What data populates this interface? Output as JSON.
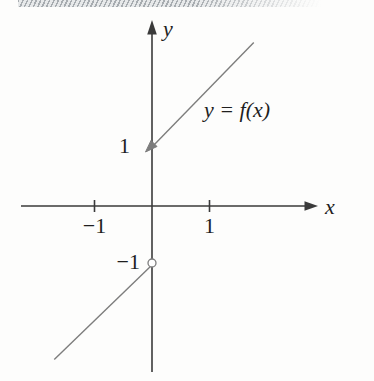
{
  "colors": {
    "axis": "#3a3a3a",
    "curve": "#7d7d7d",
    "text": "#1f1f1f",
    "band-dark": "#a7acb0",
    "band-light": "#e7e9ea",
    "bg": "#fdfdfc"
  },
  "figure": {
    "axis_labels": {
      "x": "x",
      "y": "y"
    },
    "curve_label": "y = f(x)",
    "x_tick_labels": [
      {
        "value": -1,
        "label": "−1"
      },
      {
        "value": 1,
        "label": "1"
      }
    ],
    "y_tick_labels": [
      {
        "value": 1,
        "label": "1"
      },
      {
        "value": -1,
        "label": "−1"
      }
    ]
  },
  "chart_data": {
    "type": "line",
    "title": "",
    "xlabel": "x",
    "ylabel": "y",
    "xlim": [
      -2.3,
      2.9
    ],
    "ylim": [
      -3.0,
      3.1
    ],
    "grid": false,
    "legend": false,
    "x_ticks": [
      -1,
      1
    ],
    "y_ticks": [
      1,
      -1
    ],
    "series": [
      {
        "name": "right-branch",
        "x": [
          0,
          1.77
        ],
        "y": [
          1,
          2.77
        ],
        "endpoint_marker": "closed-arrowhead-at-(0,1)"
      },
      {
        "name": "left-branch",
        "x": [
          -1.7,
          0
        ],
        "y": [
          -2.6,
          -1
        ],
        "endpoint_marker": "open-circle-at-(0,-1)"
      }
    ],
    "closed_point": {
      "x": 0,
      "y": 1
    },
    "open_point": {
      "x": 0,
      "y": -1
    },
    "annotations": [
      "y = f(x)"
    ]
  }
}
